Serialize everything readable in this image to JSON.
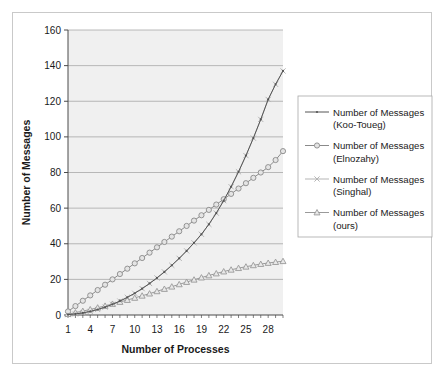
{
  "chart_data": {
    "type": "line",
    "title": "",
    "xlabel": "Number of Processes",
    "ylabel": "Number of Messages",
    "xlim": [
      1,
      30
    ],
    "ylim": [
      0,
      160
    ],
    "ytick_step": 20,
    "xticks": [
      1,
      4,
      7,
      10,
      13,
      16,
      19,
      22,
      25,
      28
    ],
    "yticks": [
      0,
      20,
      40,
      60,
      80,
      100,
      120,
      140,
      160
    ],
    "grid": "horizontal",
    "legend_position": "right",
    "x": [
      1,
      2,
      3,
      4,
      5,
      6,
      7,
      8,
      9,
      10,
      11,
      12,
      13,
      14,
      15,
      16,
      17,
      18,
      19,
      20,
      21,
      22,
      23,
      24,
      25,
      26,
      27,
      28,
      29,
      30
    ],
    "series": [
      {
        "name": "Number of Messages (Koo-Toueg)",
        "label_line1": "Number of Messages",
        "label_line2": "(Koo-Toueg)",
        "marker": "dot",
        "color": "#555555",
        "values": [
          0.2,
          0.6,
          1.2,
          2.0,
          3.1,
          4.4,
          6.0,
          7.8,
          9.9,
          12.2,
          14.8,
          17.7,
          20.8,
          24.2,
          27.9,
          31.8,
          36.0,
          40.5,
          45.3,
          50.9,
          57.2,
          64.2,
          72.0,
          80.4,
          89.5,
          99.3,
          109.8,
          121.0,
          129.5,
          137.0
        ]
      },
      {
        "name": "Number of Messages (Elnozahy)",
        "label_line1": "Number of Messages",
        "label_line2": "(Elnozahy)",
        "marker": "circle",
        "color": "#8a8a8a",
        "values": [
          2.0,
          5.0,
          8.0,
          11.0,
          14.0,
          17.0,
          20.0,
          23.0,
          26.0,
          29.0,
          32.0,
          35.0,
          38.0,
          41.0,
          44.0,
          47.0,
          50.0,
          53.0,
          56.0,
          59.0,
          62.0,
          65.0,
          68.0,
          71.0,
          74.0,
          77.0,
          80.0,
          83.0,
          87.0,
          92.0
        ]
      },
      {
        "name": "Number of Messages (Singhal)",
        "label_line1": "Number of Messages",
        "label_line2": "(Singhal)",
        "marker": "cross",
        "color": "#b5b5b5",
        "values": [
          0.2,
          0.6,
          1.2,
          2.0,
          3.1,
          4.4,
          6.0,
          7.8,
          9.9,
          12.2,
          14.8,
          17.7,
          20.8,
          24.2,
          27.9,
          31.8,
          36.0,
          40.5,
          45.3,
          50.9,
          57.2,
          64.2,
          72.0,
          80.4,
          89.5,
          99.3,
          109.8,
          121.0,
          129.5,
          137.0
        ]
      },
      {
        "name": "Number of Messages (ours)",
        "label_line1": "Number of Messages",
        "label_line2": "(ours)",
        "marker": "triangle",
        "color": "#9a9a9a",
        "values": [
          0.5,
          1.3,
          2.2,
          3.1,
          4.1,
          5.1,
          6.2,
          7.3,
          8.4,
          9.6,
          10.8,
          12.0,
          13.3,
          14.6,
          15.9,
          17.2,
          18.5,
          19.8,
          21.0,
          22.2,
          23.3,
          24.4,
          25.4,
          26.3,
          27.1,
          27.9,
          28.6,
          29.2,
          29.7,
          30.2
        ]
      }
    ]
  }
}
